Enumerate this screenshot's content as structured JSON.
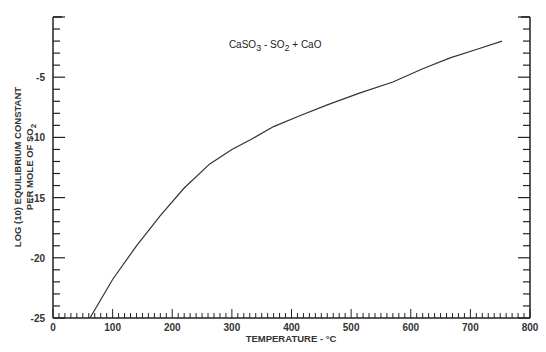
{
  "chart_data": {
    "type": "line",
    "title": "",
    "annotation": {
      "text": "CaSO3 - SO2 + CaO",
      "parts": [
        {
          "t": "CaSO"
        },
        {
          "t": "3",
          "sub": true
        },
        {
          "t": " - SO"
        },
        {
          "t": "2",
          "sub": true
        },
        {
          "t": " + CaO"
        }
      ],
      "x_temp": 295,
      "y_val": -2.6
    },
    "xlabel": "TEMPERATURE - °C",
    "ylabel_line1": "LOG (10) EQUILIBRIUM CONSTANT",
    "ylabel_line2": "PER MOLE OF SO",
    "ylabel_line2_sub": "2",
    "xlim": [
      0,
      800
    ],
    "ylim": [
      -25,
      0
    ],
    "x_ticks": [
      0,
      100,
      200,
      300,
      400,
      500,
      600,
      700,
      800
    ],
    "x_tick_labels": [
      "0",
      "100",
      "200",
      "300",
      "400",
      "500",
      "600",
      "700",
      "800"
    ],
    "y_ticks": [
      -5,
      -10,
      -15,
      -20,
      -25
    ],
    "y_tick_labels": [
      "-5",
      "-10",
      "-15",
      "-20",
      "-25"
    ],
    "x_minor_step": 10,
    "y_minor_step": 1,
    "grid": false,
    "legend": null,
    "series": [
      {
        "name": "CaSO3 - SO2 + CaO",
        "x": [
          62,
          100,
          140,
          180,
          220,
          263,
          300,
          331,
          370,
          414,
          460,
          515,
          570,
          620,
          666,
          710,
          753
        ],
        "y": [
          -25.0,
          -21.8,
          -19.0,
          -16.5,
          -14.2,
          -12.2,
          -11.0,
          -10.2,
          -9.1,
          -8.2,
          -7.3,
          -6.3,
          -5.4,
          -4.3,
          -3.4,
          -2.7,
          -2.0
        ]
      }
    ]
  }
}
